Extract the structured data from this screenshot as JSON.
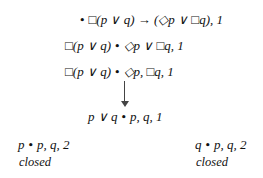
{
  "tableau": {
    "nodes": [
      {
        "left": "",
        "right": "□(p ∨ q) → (◇p ∨ □q), 1"
      },
      {
        "left": "□(p ∨ q)",
        "right": "◇p ∨ □q, 1"
      },
      {
        "left": "□(p ∨ q)",
        "right": "◇p, □q, 1"
      },
      {
        "left": "p ∨ q",
        "right": "p, q, 1"
      },
      {
        "left": "p",
        "right": "p, q, 2",
        "status": "closed"
      },
      {
        "left": "q",
        "right": "p, q, 2",
        "status": "closed"
      }
    ],
    "separator": "•"
  }
}
